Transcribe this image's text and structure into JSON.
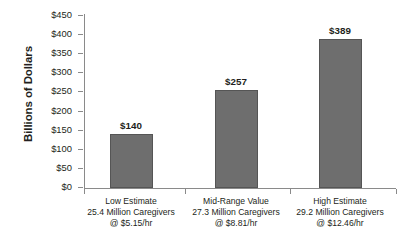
{
  "chart_data": {
    "type": "bar",
    "title": "",
    "subtitle": "",
    "xlabel": "",
    "ylabel": "Billions of Dollars",
    "ylim": [
      0,
      450
    ],
    "ytick_step": 50,
    "grid": false,
    "legend": false,
    "bar_color": "#6e6e6e",
    "bar_border_color": "#555555",
    "background": "#ffffff",
    "text_color": "#231f20",
    "categories": [
      "Low Estimate 25.4 Million Caregivers @ $5.15/hr",
      "Mid-Range Value 27.3 Million Caregivers @ $8.81/hr",
      "High Estimate 29.2 Million Caregivers @ $12.46/hr"
    ],
    "values": [
      140,
      257,
      389
    ],
    "value_labels": [
      "$140",
      "$257",
      "$389"
    ],
    "ytick_labels": [
      "$0",
      "$50",
      "$100",
      "$150",
      "$200",
      "$250",
      "$300",
      "$350",
      "$400",
      "$450"
    ],
    "ytick_values": [
      0,
      50,
      100,
      150,
      200,
      250,
      300,
      350,
      400,
      450
    ],
    "category_lines": [
      [
        "Low Estimate",
        "25.4 Million Caregivers",
        "@ $5.15/hr"
      ],
      [
        "Mid-Range Value",
        "27.3 Million Caregivers",
        "@ $8.81/hr"
      ],
      [
        "High Estimate",
        "29.2 Million Caregivers",
        "@ $12.46/hr"
      ]
    ]
  },
  "axis": {
    "y_title": "Billions of Dollars"
  }
}
